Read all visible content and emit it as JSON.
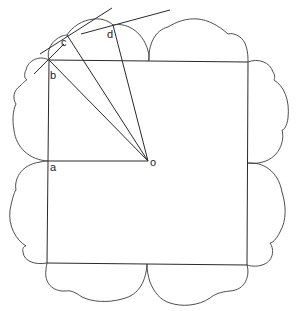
{
  "diagram": {
    "type": "geometric-construction",
    "labels": {
      "a": "a",
      "b": "b",
      "c": "c",
      "d": "d",
      "o": "o"
    },
    "points": {
      "o": [
        148,
        161
      ],
      "a": [
        48,
        161
      ],
      "b": [
        49,
        60
      ],
      "c": [
        67,
        35
      ],
      "d": [
        113,
        25
      ]
    },
    "square": [
      [
        49,
        60
      ],
      [
        248,
        62
      ],
      [
        247,
        265
      ],
      [
        47,
        263
      ]
    ],
    "colors": {
      "stroke": "#2a2a2a",
      "background": "#ffffff"
    }
  }
}
